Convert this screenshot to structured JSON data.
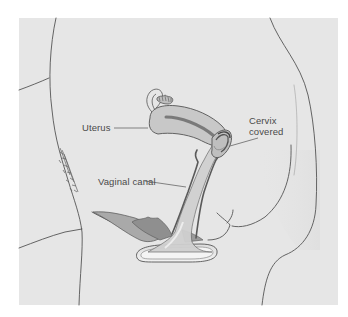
{
  "figure": {
    "background_color": "#e6e6e6",
    "line_color": "#555555",
    "labels": {
      "uterus": "Uterus",
      "vaginal_canal": "Vaginal canal",
      "cervix_line1": "Cervix",
      "cervix_line2": "covered"
    }
  }
}
